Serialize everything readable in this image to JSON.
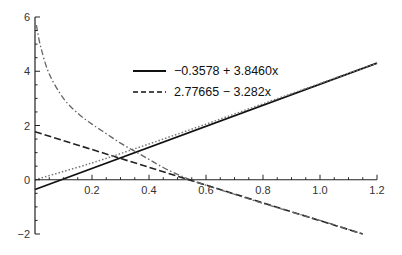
{
  "chart_data": {
    "type": "line",
    "title": "",
    "xlabel": "",
    "ylabel": "",
    "xlim": [
      0,
      1.2
    ],
    "ylim": [
      -2,
      6
    ],
    "grid": false,
    "legend_position": "upper-center",
    "x_ticks": [
      0.2,
      0.4,
      0.6,
      0.8,
      1.0,
      1.2
    ],
    "x_tick_labels": [
      "0.2",
      "0.4",
      "0.6",
      "0.8",
      "1.0",
      "1.2"
    ],
    "y_ticks": [
      -2,
      0,
      2,
      4,
      6
    ],
    "y_tick_labels": [
      "−2",
      "0",
      "2",
      "4",
      "6"
    ],
    "series": [
      {
        "name": "−0.3578 + 3.8460x",
        "style": "solid",
        "color": "#111111",
        "in_legend": true,
        "x": [
          0,
          1.2
        ],
        "y": [
          -0.36,
          4.3
        ]
      },
      {
        "name": "2.77665 − 3.282x",
        "style": "dashed",
        "color": "#222222",
        "in_legend": true,
        "x": [
          0,
          1.15
        ],
        "y": [
          1.77,
          -2.0
        ]
      },
      {
        "name": "dotted-curve",
        "style": "dotted",
        "color": "#777777",
        "in_legend": false,
        "x": [
          0,
          0.2,
          0.4,
          0.6,
          0.8,
          1.0,
          1.2
        ],
        "y": [
          0.0,
          0.62,
          1.32,
          2.05,
          2.8,
          3.55,
          4.3
        ]
      },
      {
        "name": "dash-dot-curve",
        "style": "dashdot",
        "color": "#666666",
        "in_legend": false,
        "x": [
          0.005,
          0.02,
          0.05,
          0.1,
          0.15,
          0.2,
          0.25,
          0.3,
          0.35,
          0.4,
          0.45,
          0.5,
          0.55,
          0.6,
          0.8,
          1.0,
          1.15
        ],
        "y": [
          5.7,
          4.9,
          3.9,
          3.0,
          2.45,
          2.05,
          1.7,
          1.35,
          1.05,
          0.75,
          0.45,
          0.2,
          -0.02,
          -0.2,
          -0.87,
          -1.5,
          -2.0
        ]
      }
    ]
  },
  "legend": {
    "items": [
      {
        "label": "−0.3578 + 3.8460x",
        "style": "solid"
      },
      {
        "label": "2.77665 − 3.282x",
        "style": "dashed"
      }
    ]
  }
}
